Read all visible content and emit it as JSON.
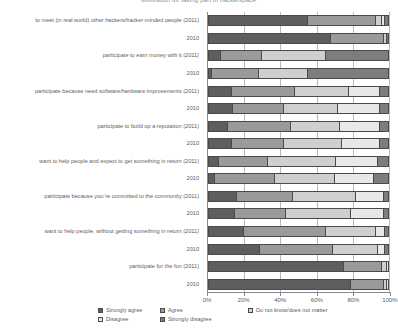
{
  "chart_data": {
    "type": "bar",
    "orientation": "horizontal",
    "stacked": true,
    "normalized": true,
    "title": "Motivation for taking part in hackerspace",
    "xlabel": "",
    "ylabel": "",
    "xlim": [
      0,
      100
    ],
    "xticks": [
      0,
      20,
      40,
      60,
      80,
      100
    ],
    "xticklabels": [
      "0%",
      "20%",
      "40%",
      "60%",
      "80%",
      "100%"
    ],
    "grid": true,
    "legend_position": "bottom",
    "series": [
      {
        "name": "Strongly agree",
        "color": "#5e5e5e"
      },
      {
        "name": "Agree",
        "color": "#9a9a9a"
      },
      {
        "name": "Do not know/does not matter",
        "color": "#cfcfcf"
      },
      {
        "name": "Disagree",
        "color": "#e8e8e8"
      },
      {
        "name": "Strongly disagree",
        "color": "#7d7d7d"
      }
    ],
    "categories": [
      "to meet (in real world) other hackers/hacker-minded people (2011)",
      "2010",
      "participate to earn money with it (2011)",
      "2010",
      "participate because need software/hardware improvements (2011)",
      "2010",
      "participate to build up a reputation (2011)",
      "2010",
      "want to help people and expect to get something in return (2011)",
      "2010",
      "participate because you`re committed to the community (2011)",
      "2010",
      "want to help people, without getting something in return (2011)",
      "2010",
      "participate for the fun (2011)",
      "2010"
    ],
    "values": [
      [
        55,
        38,
        3,
        2,
        2
      ],
      [
        68,
        29,
        2,
        0,
        1
      ],
      [
        7,
        23,
        35,
        0,
        35
      ],
      [
        2,
        26,
        27,
        0,
        45
      ],
      [
        13,
        35,
        30,
        17,
        5
      ],
      [
        14,
        28,
        30,
        23,
        5
      ],
      [
        11,
        35,
        27,
        22,
        5
      ],
      [
        13,
        29,
        32,
        21,
        5
      ],
      [
        6,
        27,
        38,
        23,
        6
      ],
      [
        4,
        33,
        33,
        22,
        8
      ],
      [
        16,
        31,
        35,
        15,
        3
      ],
      [
        15,
        28,
        36,
        18,
        3
      ],
      [
        20,
        45,
        28,
        5,
        2
      ],
      [
        29,
        40,
        25,
        4,
        2
      ],
      [
        75,
        21,
        3,
        1,
        0
      ],
      [
        79,
        18,
        2,
        1,
        0
      ]
    ]
  }
}
